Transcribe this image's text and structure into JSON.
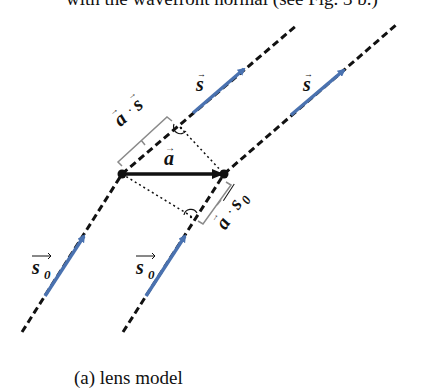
{
  "top_text_partial": "with the wavefront normal (see Fig. 3 b.)",
  "caption_partial": "(a) lens model",
  "colors": {
    "line": "#111111",
    "arrow_blue": "#4a72b0",
    "bracket": "#8a8a8a"
  },
  "labels": {
    "s_upper_left": "s",
    "s_upper_right": "s",
    "s0_lower_left": "s",
    "s0_lower_right": "s",
    "s0_subscript": "0",
    "a_vector": "a",
    "a_dot_s": "a · s",
    "a_dot_s0": "a · s",
    "vector_arrow": "→"
  },
  "points": {
    "A": [
      122,
      174
    ],
    "B": [
      224,
      174
    ]
  }
}
